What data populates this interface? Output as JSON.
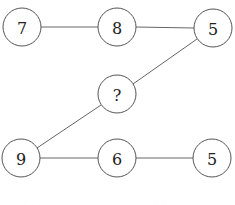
{
  "puzzle": {
    "nodes": [
      {
        "id": "n1",
        "label": "7",
        "cx": 22,
        "cy": 27
      },
      {
        "id": "n2",
        "label": "8",
        "cx": 117,
        "cy": 27
      },
      {
        "id": "n3",
        "label": "5",
        "cx": 213,
        "cy": 28
      },
      {
        "id": "n4",
        "label": "?",
        "cx": 117,
        "cy": 94
      },
      {
        "id": "n5",
        "label": "9",
        "cx": 21,
        "cy": 158
      },
      {
        "id": "n6",
        "label": "6",
        "cx": 117,
        "cy": 158
      },
      {
        "id": "n7",
        "label": "5",
        "cx": 212,
        "cy": 158
      }
    ],
    "edges": [
      [
        "n1",
        "n2"
      ],
      [
        "n2",
        "n3"
      ],
      [
        "n3",
        "n4"
      ],
      [
        "n4",
        "n5"
      ],
      [
        "n5",
        "n6"
      ],
      [
        "n6",
        "n7"
      ]
    ],
    "radius": 19
  },
  "options": [
    {
      "key": "(b)",
      "value": "7"
    },
    {
      "key": "(c)",
      "value": "8"
    }
  ],
  "colors": {
    "stroke": "#555555",
    "text": "#222222",
    "background": "#ffffff"
  }
}
